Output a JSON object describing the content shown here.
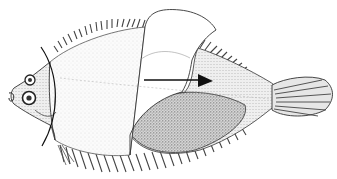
{
  "figure": {
    "colors": {
      "background": "#ffffff",
      "ink": "#1a1a1a",
      "stipple_light": "#d9d9d9",
      "stipple_dark": "#6e6e6e"
    },
    "elements": {
      "head": "fish-head",
      "left_eye": "upper-eye",
      "right_eye": "lower-eye",
      "cutaway_panel": "cutaway-flap",
      "arrow": "direction-arrow",
      "curved_line": "section-line",
      "tail": "caudal-fin",
      "dorsal_fin": "dorsal-fin",
      "anal_fin": "anal-fin"
    }
  }
}
